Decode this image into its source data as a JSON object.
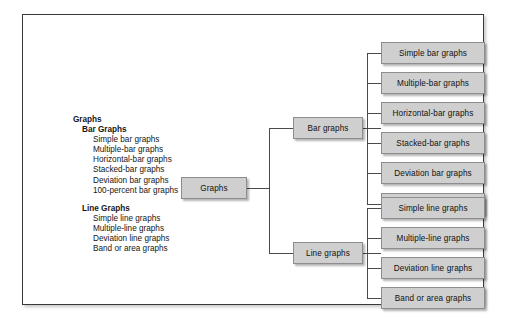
{
  "figure": {
    "outline": {
      "root_label": "Graphs",
      "groups": [
        {
          "heading": "Bar Graphs",
          "items": [
            "Simple bar graphs",
            "Multiple-bar graphs",
            "Horizontal-bar graphs",
            "Stacked-bar graphs",
            "Deviation bar graphs",
            "100-percent bar graphs"
          ]
        },
        {
          "heading": "Line Graphs",
          "items": [
            "Simple line graphs",
            "Multiple-line graphs",
            "Deviation line graphs",
            "Band or area graphs"
          ]
        }
      ]
    },
    "tree": {
      "root": "Graphs",
      "branches": [
        {
          "label": "Bar graphs",
          "leaves": [
            "Simple bar graphs",
            "Multiple-bar graphs",
            "Horizontal-bar graphs",
            "Stacked-bar graphs",
            "Deviation bar graphs",
            "100-percent bar graphs"
          ]
        },
        {
          "label": "Line graphs",
          "leaves": [
            "Simple line graphs",
            "Multiple-line graphs",
            "Deviation line graphs",
            "Band or area graphs"
          ]
        }
      ]
    },
    "colors": {
      "node_fill": "#cfcfcf",
      "node_border": "#8d8d8d",
      "frame_border": "#3a3a3a",
      "connector": "#4a4a4a",
      "background": "#ffffff",
      "text": "#111111"
    }
  }
}
